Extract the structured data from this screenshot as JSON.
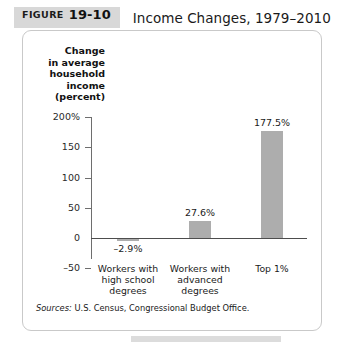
{
  "figure": {
    "label_word": "FIGURE",
    "label_number": "19-10",
    "title": "Income Changes, 1979–2010"
  },
  "source": {
    "label": "Sources:",
    "text": "U.S. Census, Congressional Budget Office."
  },
  "colors": {
    "bar_fill": "#adadad",
    "badge_background": "#d8d8d8",
    "axis": "#4d4d4d",
    "panel_border": "#c9c9c9"
  },
  "chart_data": {
    "type": "bar",
    "title": "Income Changes, 1979–2010",
    "xlabel": "",
    "ylabel": "Change in average household income (percent)",
    "ylabel_lines": [
      "Change",
      "in average",
      "household",
      "income",
      "(percent)"
    ],
    "categories": [
      "Workers with high school degrees",
      "Workers with advanced degrees",
      "Top 1%"
    ],
    "category_lines": [
      [
        "Workers with",
        "high school",
        "degrees"
      ],
      [
        "Workers with",
        "advanced",
        "degrees"
      ],
      [
        "Top 1%"
      ]
    ],
    "values": [
      -2.9,
      27.6,
      177.5
    ],
    "value_labels": [
      "–2.9%",
      "27.6%",
      "177.5%"
    ],
    "ylim": [
      -50,
      200
    ],
    "yticks": [
      200,
      150,
      100,
      50,
      0,
      -50
    ],
    "ytick_labels": [
      "200%",
      "150",
      "100",
      "50",
      "0",
      "–50"
    ],
    "grid": false,
    "legend": "none"
  }
}
